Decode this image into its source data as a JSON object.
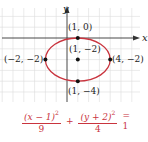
{
  "graph": {
    "axis_labels": {
      "x": "x",
      "y": "y"
    },
    "origin_px": {
      "x": 67,
      "y": 38
    },
    "unit_px": 10.8,
    "grid_bounds_px": {
      "left": 0,
      "top": 8,
      "right": 140,
      "bottom": 102
    },
    "ellipse": {
      "center": [
        1,
        -2
      ],
      "a": 3,
      "b": 2,
      "color": "#c9343e"
    },
    "points": [
      {
        "label": "(1, 0)",
        "coords": [
          1,
          0
        ]
      },
      {
        "label": "(1, −2)",
        "coords": [
          1,
          -2
        ]
      },
      {
        "label": "(−2, −2)",
        "coords": [
          -2,
          -2
        ]
      },
      {
        "label": "(4, −2)",
        "coords": [
          4,
          -2
        ]
      },
      {
        "label": "(1, −4)",
        "coords": [
          1,
          -4
        ]
      }
    ],
    "colors": {
      "grid": "#d9d9d9",
      "axis": "#333333",
      "ellipse": "#c9343e",
      "point": "#111111"
    }
  },
  "equation": {
    "term1": {
      "numerator_base": "(x − 1)",
      "numerator_exp": "2",
      "denominator": "9"
    },
    "plus": "+",
    "term2": {
      "numerator_base": "(y + 2)",
      "numerator_exp": "2",
      "denominator": "4"
    },
    "equals": "= 1",
    "color": "#c9343e"
  }
}
